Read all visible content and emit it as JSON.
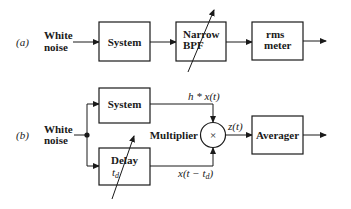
{
  "diagram_a": {
    "label": "(a)",
    "input_label_line1": "White",
    "input_label_line2": "noise",
    "blocks": {
      "system": "System",
      "bpf_line1": "Narrow",
      "bpf_line2": "BPF",
      "rms_line1": "rms",
      "rms_line2": "meter"
    }
  },
  "diagram_b": {
    "label": "(b)",
    "input_label_line1": "White",
    "input_label_line2": "noise",
    "blocks": {
      "system": "System",
      "delay": "Delay",
      "delay_param": "t",
      "delay_param_sub": "d",
      "multiplier": "Multiplier",
      "multiplier_symbol": "×",
      "averager": "Averager"
    },
    "signals": {
      "system_out": "h * x(t)",
      "delay_out_prefix": "x(t − t",
      "delay_out_sub": "d",
      "delay_out_suffix": ")",
      "mult_out": "z(t)"
    }
  }
}
